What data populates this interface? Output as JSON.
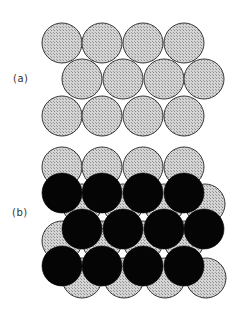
{
  "figure": {
    "panels": [
      {
        "label": "(a)",
        "description": "Single close-packed layer of spheres",
        "layers": [
          {
            "name": "layer-A",
            "fill": "hatched-gray",
            "rows": [
              {
                "y": 43,
                "x": [
                  62,
                  102,
                  143,
                  184
                ]
              },
              {
                "y": 79,
                "x": [
                  82,
                  123,
                  164,
                  204
                ]
              },
              {
                "y": 116,
                "x": [
                  62,
                  102,
                  143,
                  184
                ]
              }
            ]
          }
        ]
      },
      {
        "label": "(b)",
        "description": "Second close-packed layer (black) on top of first layer (gray)",
        "layers": [
          {
            "name": "layer-A",
            "fill": "hatched-gray",
            "rows": [
              {
                "y": 167,
                "x": [
                  62,
                  102,
                  143,
                  184
                ]
              },
              {
                "y": 204,
                "x": [
                  82,
                  123,
                  164,
                  205
                ]
              },
              {
                "y": 241,
                "x": [
                  62,
                  102,
                  143,
                  184
                ]
              },
              {
                "y": 278,
                "x": [
                  82,
                  124,
                  165,
                  206
                ]
              }
            ]
          },
          {
            "name": "layer-B",
            "fill": "black",
            "rows": [
              {
                "y": 193,
                "x": [
                  62,
                  102,
                  143,
                  184
                ]
              },
              {
                "y": 229,
                "x": [
                  82,
                  123,
                  164,
                  204
                ]
              },
              {
                "y": 266,
                "x": [
                  62,
                  102,
                  143,
                  184
                ]
              }
            ]
          }
        ]
      }
    ],
    "sphere_radius": 20,
    "colors": {
      "gray_fill": "#c8c8c8",
      "hatch_dark": "#8a8a8a",
      "outline": "#3a3a3a",
      "black_fill": "#050505",
      "background": "#ffffff"
    }
  }
}
